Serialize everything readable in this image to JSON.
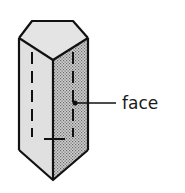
{
  "diagram": {
    "labels": [
      {
        "text": "face",
        "points_to": "front-right rectangular face"
      }
    ],
    "colors": {
      "outline": "#111111",
      "light_face": "#e2e2e2",
      "shaded_face": "#bdbdbd",
      "dot_pattern": "#6a6a6a",
      "background": "#ffffff"
    }
  }
}
